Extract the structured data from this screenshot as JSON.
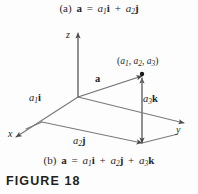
{
  "figure": {
    "label": "FIGURE 18",
    "background_color": "#fdfdfd",
    "line_color": "#6f6f6f",
    "text_color": "#231f20"
  },
  "caption_a": {
    "part": "(a)",
    "vector": "a",
    "equals": "=",
    "term1_coef": "a",
    "term1_sub": "1",
    "term1_unit": "i",
    "plus1": "+",
    "term2_coef": "a",
    "term2_sub": "2",
    "term2_unit": "j",
    "full_text": "(a) a = a1i + a2j"
  },
  "caption_b": {
    "part": "(b)",
    "vector": "a",
    "equals": "=",
    "term1_coef": "a",
    "term1_sub": "1",
    "term1_unit": "i",
    "plus1": "+",
    "term2_coef": "a",
    "term2_sub": "2",
    "term2_unit": "j",
    "plus2": "+",
    "term3_coef": "a",
    "term3_sub": "3",
    "term3_unit": "k",
    "full_text": "(b) a = a1i + a2j + a3k"
  },
  "diagram": {
    "axes": {
      "z": "z",
      "x": "x",
      "y": "y"
    },
    "point": {
      "open_paren": "(",
      "c1": "a",
      "c1_sub": "1",
      "sep1": ", ",
      "c2": "a",
      "c2_sub": "2",
      "sep2": ", ",
      "c3": "a",
      "c3_sub": "3",
      "close_paren": ")",
      "full_text": "(a1, a2, a3)"
    },
    "vector_label": "a",
    "component_x": {
      "coef": "a",
      "sub": "1",
      "unit": "i",
      "full_text": "a1i"
    },
    "component_y": {
      "coef": "a",
      "sub": "2",
      "unit": "j",
      "full_text": "a2j"
    },
    "component_z": {
      "coef": "a",
      "sub": "3",
      "unit": "k",
      "full_text": "a3k"
    }
  }
}
